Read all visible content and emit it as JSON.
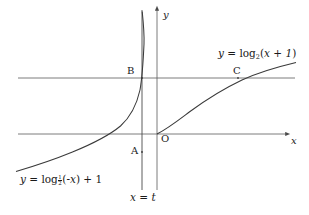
{
  "figure": {
    "background_color": "#ffffff",
    "stroke_color": "#4a4a4a",
    "curve_color": "#3a3a3a",
    "text_color": "#1a1a1a",
    "width": 309,
    "height": 215
  },
  "axes": {
    "x_axis": {
      "label": "x",
      "y_pixel": 134,
      "x_start": 18,
      "x_end": 288,
      "arrow": "right"
    },
    "y_axis": {
      "label": "y",
      "x_pixel": 157,
      "y_top": 8,
      "y_bottom": 190,
      "arrow": "up"
    },
    "origin": {
      "label": "O",
      "x_pixel": 157,
      "y_pixel": 134
    }
  },
  "helper_lines": [
    {
      "name": "horizontal-level-line",
      "orientation": "horizontal",
      "y_pixel": 78,
      "x_start": 18,
      "x_end": 295
    },
    {
      "name": "vertical-line-x-equals-t",
      "orientation": "vertical",
      "x_pixel": 142,
      "y_start": 10,
      "y_end": 190,
      "label": "x = t",
      "label_x": "x",
      "label_eq": "=",
      "label_t": "t"
    }
  ],
  "points": [
    {
      "name": "A",
      "label": "A",
      "x_pixel": 142,
      "y_pixel": 152,
      "label_x": 131,
      "label_y": 146,
      "description": "lower intersection of steep curve with line x = t"
    },
    {
      "name": "B",
      "label": "B",
      "x_pixel": 142,
      "y_pixel": 78,
      "label_x": 127,
      "label_y": 66,
      "description": "intersection of steep curve with horizontal line at x = t"
    },
    {
      "name": "C",
      "label": "C",
      "x_pixel": 238,
      "y_pixel": 78,
      "label_x": 233,
      "label_y": 66,
      "description": "intersection of log base 2 curve with horizontal line"
    },
    {
      "name": "O",
      "label": "O",
      "x_pixel": 157,
      "y_pixel": 134,
      "label_x": 161,
      "label_y": 134,
      "description": "origin, curve y = log_2(x+1) passes through it"
    }
  ],
  "curves": [
    {
      "name": "curve-log2",
      "equation_text": "y = log_2(x + 1)",
      "base": "2",
      "label": {
        "y": "y",
        "eq": "=",
        "log": "log",
        "subscript": "2",
        "arg_open": "(",
        "arg": "x + 1",
        "arg_close": ")",
        "x_pixel": 218,
        "y_pixel": 50
      },
      "path": "M 157 134 C 168 128 178 120 190 111 C 205 100 222 89 242 80 C 258 73 275 68 296 63",
      "passes_through": [
        "O",
        "C"
      ]
    },
    {
      "name": "curve-log-half",
      "equation_text": "y = log_(1/2)(-x) + 1",
      "base_numerator": "1",
      "base_denominator": "2",
      "label": {
        "y": "y",
        "eq": "=",
        "log": "log",
        "sub_num": "1",
        "sub_den": "2",
        "arg_open": "(",
        "arg": "-x",
        "arg_close": ")",
        "plus": "+ 1",
        "x_pixel": 20,
        "y_pixel": 176
      },
      "path": "M 16 171 C 32 166 52 160 72 152 C 92 144 108 136 120 126 C 131 116 137 103 140 90 C 142 78 143 62 144 44 C 144 32 143 22 142 12",
      "passes_through": [
        "A",
        "B"
      ]
    }
  ],
  "labels": {
    "y_axis_label": "y",
    "x_axis_label": "x"
  }
}
